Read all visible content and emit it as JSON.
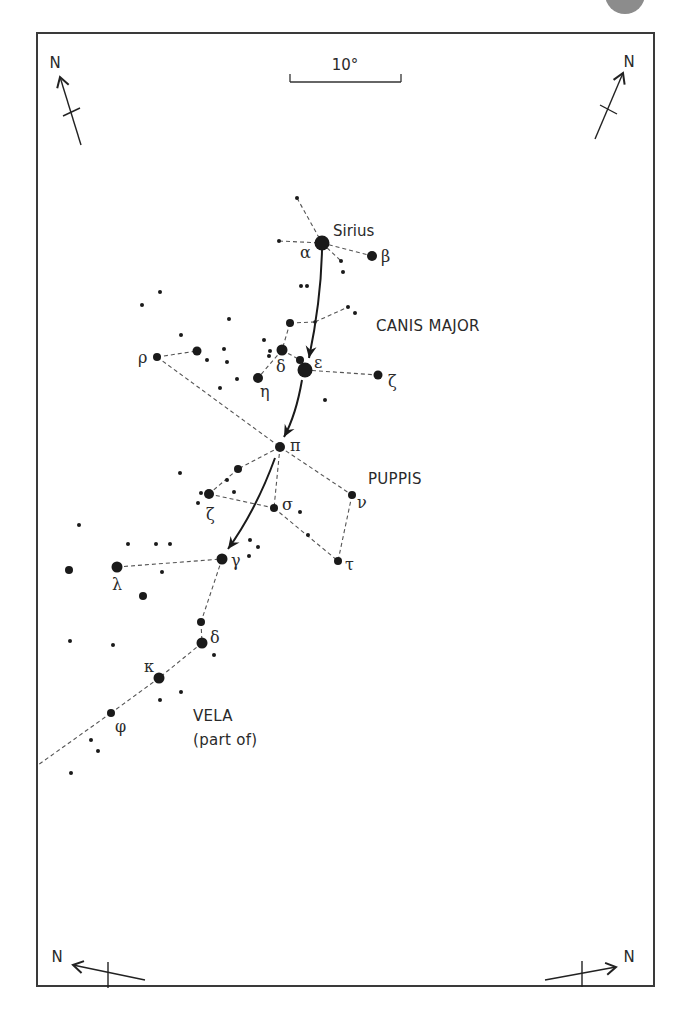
{
  "frame": {
    "x": 37,
    "y": 33,
    "w": 617,
    "h": 953
  },
  "decor": {
    "corner_ball": {
      "cx": 625,
      "cy": -6,
      "r": 20,
      "color": "#8c8c8c"
    }
  },
  "scale_bar": {
    "label": "10°",
    "x1": 290,
    "x2": 401,
    "y": 82,
    "tick": 8,
    "label_x": 345,
    "label_y": 70
  },
  "compass": [
    {
      "id": "top-left",
      "label": "N",
      "label_x": 55,
      "label_y": 68,
      "from": [
        81,
        145
      ],
      "to": [
        60,
        77
      ],
      "tick": [
        [
          63,
          116
        ],
        [
          80,
          108
        ]
      ]
    },
    {
      "id": "top-right",
      "label": "N",
      "label_x": 629,
      "label_y": 67,
      "from": [
        595,
        139
      ],
      "to": [
        623,
        73
      ],
      "tick": [
        [
          600,
          105
        ],
        [
          617,
          114
        ]
      ]
    },
    {
      "id": "bottom-left",
      "label": "N",
      "label_x": 57,
      "label_y": 962,
      "from": [
        145,
        980
      ],
      "to": [
        73,
        965
      ],
      "tick": [
        [
          108,
          962
        ],
        [
          108,
          988
        ]
      ]
    },
    {
      "id": "bottom-right",
      "label": "N",
      "label_x": 629,
      "label_y": 962,
      "from": [
        545,
        980
      ],
      "to": [
        616,
        967
      ],
      "tick": [
        [
          582,
          961
        ],
        [
          582,
          987
        ]
      ]
    }
  ],
  "constellations": [
    {
      "name": "CANIS MAJOR",
      "x": 376,
      "y": 331
    },
    {
      "name": "PUPPIS",
      "x": 368,
      "y": 484
    },
    {
      "name": "VELA",
      "x": 193,
      "y": 721
    },
    {
      "name": "(part of)",
      "x": 193,
      "y": 745
    }
  ],
  "named_star": {
    "name": "Sirius",
    "x": 333,
    "y": 236
  },
  "stars": [
    {
      "x": 322,
      "y": 243,
      "r": 7.5,
      "label": "α",
      "lx": 300,
      "ly": 258
    },
    {
      "x": 372,
      "y": 256,
      "r": 5,
      "label": "β",
      "lx": 381,
      "ly": 262
    },
    {
      "x": 297,
      "y": 198,
      "r": 2
    },
    {
      "x": 279,
      "y": 241,
      "r": 2
    },
    {
      "x": 341,
      "y": 261,
      "r": 2
    },
    {
      "x": 343,
      "y": 272,
      "r": 2
    },
    {
      "x": 301,
      "y": 286,
      "r": 2
    },
    {
      "x": 307,
      "y": 286,
      "r": 2
    },
    {
      "x": 348,
      "y": 307,
      "r": 2
    },
    {
      "x": 355,
      "y": 313,
      "r": 2
    },
    {
      "x": 290,
      "y": 323,
      "r": 4
    },
    {
      "x": 315,
      "y": 322,
      "r": 1.8
    },
    {
      "x": 282,
      "y": 350,
      "r": 5.5,
      "label": "δ",
      "lx": 276,
      "ly": 372
    },
    {
      "x": 300,
      "y": 360,
      "r": 4
    },
    {
      "x": 305,
      "y": 370,
      "r": 7.5,
      "label": "ε",
      "lx": 314,
      "ly": 368
    },
    {
      "x": 378,
      "y": 375,
      "r": 4.5,
      "label": "ζ",
      "lx": 388,
      "ly": 387
    },
    {
      "x": 258,
      "y": 378,
      "r": 5,
      "label": "η",
      "lx": 260,
      "ly": 397
    },
    {
      "x": 264,
      "y": 340,
      "r": 2
    },
    {
      "x": 270,
      "y": 351,
      "r": 2
    },
    {
      "x": 269,
      "y": 356,
      "r": 2
    },
    {
      "x": 325,
      "y": 400,
      "r": 2
    },
    {
      "x": 160,
      "y": 292,
      "r": 2
    },
    {
      "x": 142,
      "y": 305,
      "r": 2
    },
    {
      "x": 229,
      "y": 319,
      "r": 2
    },
    {
      "x": 181,
      "y": 335,
      "r": 2
    },
    {
      "x": 157,
      "y": 357,
      "r": 4,
      "label": "ρ",
      "lx": 138,
      "ly": 363
    },
    {
      "x": 197,
      "y": 351,
      "r": 4.5
    },
    {
      "x": 224,
      "y": 349,
      "r": 2
    },
    {
      "x": 227,
      "y": 362,
      "r": 2
    },
    {
      "x": 207,
      "y": 360,
      "r": 2
    },
    {
      "x": 237,
      "y": 379,
      "r": 2
    },
    {
      "x": 220,
      "y": 388,
      "r": 2
    },
    {
      "x": 280,
      "y": 447,
      "r": 5,
      "label": "π",
      "lx": 290,
      "ly": 451
    },
    {
      "x": 238,
      "y": 469,
      "r": 4
    },
    {
      "x": 180,
      "y": 473,
      "r": 2
    },
    {
      "x": 227,
      "y": 480,
      "r": 2
    },
    {
      "x": 209,
      "y": 494,
      "r": 5,
      "label": "ζ",
      "lx": 206,
      "ly": 520
    },
    {
      "x": 201,
      "y": 493,
      "r": 2
    },
    {
      "x": 234,
      "y": 492,
      "r": 2
    },
    {
      "x": 198,
      "y": 503,
      "r": 2
    },
    {
      "x": 274,
      "y": 508,
      "r": 4,
      "label": "σ",
      "lx": 282,
      "ly": 510
    },
    {
      "x": 300,
      "y": 512,
      "r": 2
    },
    {
      "x": 308,
      "y": 535,
      "r": 2
    },
    {
      "x": 352,
      "y": 495,
      "r": 4,
      "label": "ν",
      "lx": 357,
      "ly": 508
    },
    {
      "x": 338,
      "y": 561,
      "r": 4,
      "label": "τ",
      "lx": 345,
      "ly": 570
    },
    {
      "x": 222,
      "y": 559,
      "r": 5.5,
      "label": "γ",
      "lx": 231,
      "ly": 566
    },
    {
      "x": 250,
      "y": 540,
      "r": 2
    },
    {
      "x": 258,
      "y": 547,
      "r": 2
    },
    {
      "x": 249,
      "y": 556,
      "r": 2
    },
    {
      "x": 79,
      "y": 525,
      "r": 2
    },
    {
      "x": 128,
      "y": 544,
      "r": 2
    },
    {
      "x": 156,
      "y": 544,
      "r": 2
    },
    {
      "x": 170,
      "y": 544,
      "r": 2
    },
    {
      "x": 69,
      "y": 570,
      "r": 4
    },
    {
      "x": 117,
      "y": 567,
      "r": 5.5,
      "label": "λ",
      "lx": 112,
      "ly": 590
    },
    {
      "x": 162,
      "y": 572,
      "r": 2
    },
    {
      "x": 143,
      "y": 596,
      "r": 4
    },
    {
      "x": 201,
      "y": 622,
      "r": 4
    },
    {
      "x": 202,
      "y": 643,
      "r": 5.5,
      "label": "δ",
      "lx": 210,
      "ly": 643
    },
    {
      "x": 70,
      "y": 641,
      "r": 2
    },
    {
      "x": 113,
      "y": 645,
      "r": 2
    },
    {
      "x": 214,
      "y": 655,
      "r": 2
    },
    {
      "x": 159,
      "y": 678,
      "r": 5.5,
      "label": "κ",
      "lx": 144,
      "ly": 672
    },
    {
      "x": 160,
      "y": 700,
      "r": 2
    },
    {
      "x": 181,
      "y": 692,
      "r": 2
    },
    {
      "x": 111,
      "y": 713,
      "r": 4,
      "label": "φ",
      "lx": 115,
      "ly": 732
    },
    {
      "x": 91,
      "y": 740,
      "r": 2
    },
    {
      "x": 98,
      "y": 751,
      "r": 2
    },
    {
      "x": 71,
      "y": 773,
      "r": 2
    }
  ],
  "lines": [
    [
      [
        297,
        198
      ],
      [
        322,
        243
      ]
    ],
    [
      [
        279,
        241
      ],
      [
        322,
        243
      ]
    ],
    [
      [
        322,
        243
      ],
      [
        372,
        256
      ]
    ],
    [
      [
        322,
        243
      ],
      [
        341,
        261
      ]
    ],
    [
      [
        290,
        323
      ],
      [
        315,
        322
      ]
    ],
    [
      [
        315,
        322
      ],
      [
        348,
        307
      ]
    ],
    [
      [
        290,
        323
      ],
      [
        282,
        350
      ]
    ],
    [
      [
        282,
        350
      ],
      [
        258,
        378
      ]
    ],
    [
      [
        282,
        350
      ],
      [
        300,
        360
      ]
    ],
    [
      [
        300,
        360
      ],
      [
        305,
        370
      ]
    ],
    [
      [
        305,
        370
      ],
      [
        378,
        375
      ]
    ],
    [
      [
        157,
        357
      ],
      [
        197,
        351
      ]
    ],
    [
      [
        157,
        357
      ],
      [
        280,
        447
      ]
    ],
    [
      [
        280,
        447
      ],
      [
        238,
        469
      ]
    ],
    [
      [
        238,
        469
      ],
      [
        209,
        494
      ]
    ],
    [
      [
        209,
        494
      ],
      [
        274,
        508
      ]
    ],
    [
      [
        280,
        447
      ],
      [
        274,
        508
      ]
    ],
    [
      [
        280,
        447
      ],
      [
        352,
        495
      ]
    ],
    [
      [
        274,
        508
      ],
      [
        338,
        561
      ]
    ],
    [
      [
        352,
        495
      ],
      [
        338,
        561
      ]
    ],
    [
      [
        117,
        567
      ],
      [
        222,
        559
      ]
    ],
    [
      [
        222,
        559
      ],
      [
        201,
        622
      ]
    ],
    [
      [
        201,
        622
      ],
      [
        202,
        643
      ]
    ],
    [
      [
        202,
        643
      ],
      [
        159,
        678
      ]
    ],
    [
      [
        159,
        678
      ],
      [
        111,
        713
      ]
    ],
    [
      [
        111,
        713
      ],
      [
        38,
        765
      ]
    ]
  ],
  "arrows": [
    {
      "d": "M 322 250 Q 321 300 309 358",
      "head": [
        309,
        358
      ],
      "angle": 100
    },
    {
      "d": "M 302 380 Q 296 415 284 437",
      "head": [
        284,
        437
      ],
      "angle": 118
    },
    {
      "d": "M 275 458 Q 256 510 228 549",
      "head": [
        228,
        549
      ],
      "angle": 126
    }
  ]
}
